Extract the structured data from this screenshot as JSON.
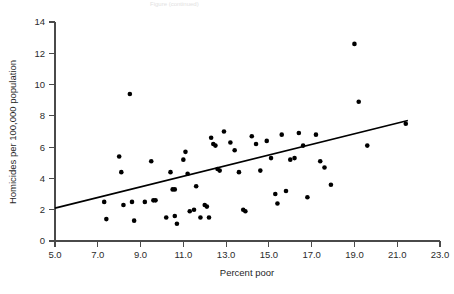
{
  "figure": {
    "caption_fragment": "Figure  (continued)"
  },
  "chart_data": {
    "type": "scatter",
    "title": "",
    "xlabel": "Percent poor",
    "ylabel": "Homicides per 100,000 population",
    "xlim": [
      5.0,
      23.0
    ],
    "ylim": [
      0,
      14
    ],
    "xticks": [
      "5.0",
      "7.0",
      "9.0",
      "11.0",
      "13.0",
      "15.0",
      "17.0",
      "19.0",
      "21.0",
      "23.0"
    ],
    "xtick_values": [
      5.0,
      7.0,
      9.0,
      11.0,
      13.0,
      15.0,
      17.0,
      19.0,
      21.0,
      23.0
    ],
    "yticks": [
      "0",
      "2",
      "4",
      "6",
      "8",
      "10",
      "12",
      "14"
    ],
    "ytick_values": [
      0,
      2,
      4,
      6,
      8,
      10,
      12,
      14
    ],
    "grid": false,
    "legend": false,
    "marker": "filled-circle",
    "marker_color": "#000000",
    "points": [
      [
        7.3,
        2.5
      ],
      [
        7.4,
        1.4
      ],
      [
        8.0,
        5.4
      ],
      [
        8.1,
        4.4
      ],
      [
        8.2,
        2.3
      ],
      [
        8.5,
        9.4
      ],
      [
        8.6,
        2.5
      ],
      [
        8.7,
        1.3
      ],
      [
        9.2,
        2.5
      ],
      [
        9.5,
        5.1
      ],
      [
        9.6,
        2.6
      ],
      [
        9.7,
        2.6
      ],
      [
        10.2,
        1.5
      ],
      [
        10.4,
        4.4
      ],
      [
        10.5,
        3.3
      ],
      [
        10.6,
        3.3
      ],
      [
        10.6,
        1.6
      ],
      [
        10.7,
        1.1
      ],
      [
        11.0,
        5.2
      ],
      [
        11.1,
        5.7
      ],
      [
        11.2,
        4.3
      ],
      [
        11.3,
        1.9
      ],
      [
        11.5,
        2.0
      ],
      [
        11.6,
        3.5
      ],
      [
        11.8,
        1.5
      ],
      [
        12.0,
        2.3
      ],
      [
        12.1,
        2.2
      ],
      [
        12.2,
        1.5
      ],
      [
        12.3,
        6.6
      ],
      [
        12.4,
        6.2
      ],
      [
        12.5,
        6.1
      ],
      [
        12.6,
        4.6
      ],
      [
        12.7,
        4.5
      ],
      [
        12.9,
        7.0
      ],
      [
        13.2,
        6.3
      ],
      [
        13.4,
        5.8
      ],
      [
        13.6,
        4.4
      ],
      [
        13.8,
        2.0
      ],
      [
        13.9,
        1.9
      ],
      [
        14.2,
        6.7
      ],
      [
        14.4,
        6.2
      ],
      [
        14.6,
        4.5
      ],
      [
        14.9,
        6.4
      ],
      [
        15.1,
        5.3
      ],
      [
        15.3,
        3.0
      ],
      [
        15.4,
        2.4
      ],
      [
        15.6,
        6.8
      ],
      [
        15.8,
        3.2
      ],
      [
        16.0,
        5.2
      ],
      [
        16.2,
        5.3
      ],
      [
        16.4,
        6.9
      ],
      [
        16.6,
        6.1
      ],
      [
        16.8,
        2.8
      ],
      [
        17.2,
        6.8
      ],
      [
        17.4,
        5.1
      ],
      [
        17.6,
        4.7
      ],
      [
        17.9,
        3.6
      ],
      [
        19.0,
        12.6
      ],
      [
        19.2,
        8.9
      ],
      [
        19.6,
        6.1
      ],
      [
        21.4,
        7.5
      ]
    ],
    "fit_line": {
      "label": "least-squares regression line",
      "x_start": 5.0,
      "y_start": 2.1,
      "x_end": 21.5,
      "y_end": 7.7,
      "color": "#000000"
    }
  }
}
